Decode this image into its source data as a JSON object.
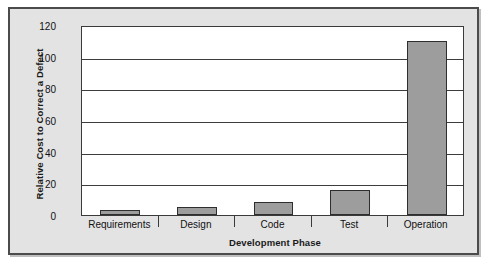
{
  "figure": {
    "frame_color": "#4b4b4b",
    "panel_color": "#e3e3e3",
    "plot_background": "#ffffff"
  },
  "chart_data": {
    "type": "bar",
    "title": "",
    "xlabel": "Development Phase",
    "ylabel": "Relative Cost to Correct a Defect",
    "categories": [
      "Requirements",
      "Design",
      "Code",
      "Test",
      "Operation"
    ],
    "values": [
      3,
      5,
      8,
      16,
      110
    ],
    "ylim": [
      0,
      120
    ],
    "yticks": [
      0,
      20,
      40,
      60,
      80,
      100,
      120
    ],
    "ytick_labels": [
      "0",
      "20",
      "40",
      "60",
      "80",
      "100",
      "120"
    ],
    "grid": "horizontal",
    "legend": "none",
    "bar_fill_color": "#9d9d9d",
    "bar_edge_color": "#2e2e2e",
    "gridline_color": "#3d3d3d"
  }
}
